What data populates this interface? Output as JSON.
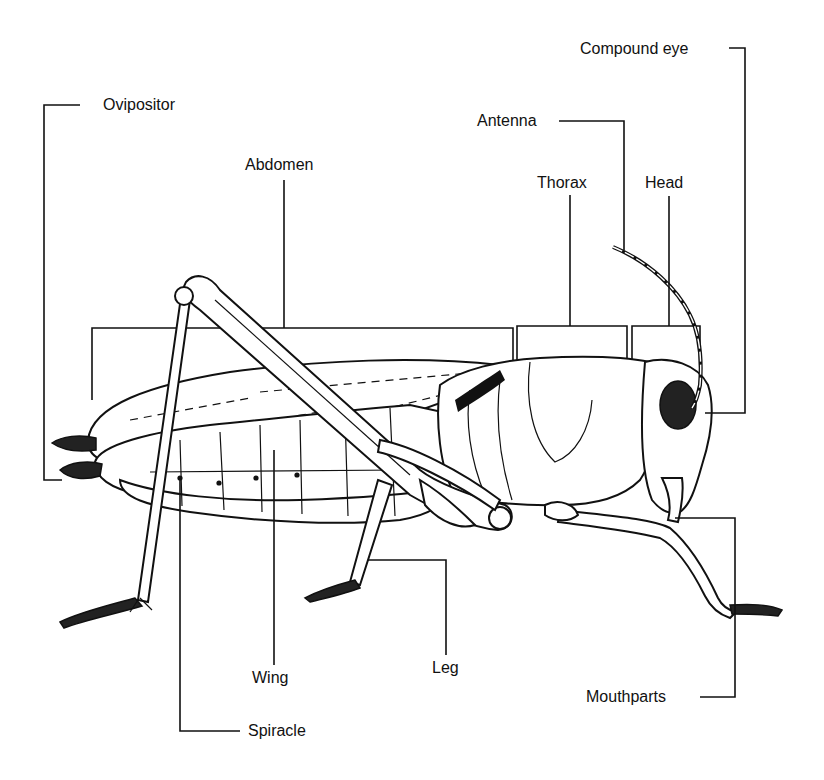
{
  "diagram": {
    "colors": {
      "ink": "#111111",
      "background": "#ffffff"
    },
    "labels": {
      "compound_eye": "Compound eye",
      "ovipositor": "Ovipositor",
      "antenna": "Antenna",
      "abdomen": "Abdomen",
      "thorax": "Thorax",
      "head": "Head",
      "wing": "Wing",
      "leg": "Leg",
      "mouthparts": "Mouthparts",
      "spiracle": "Spiracle"
    }
  }
}
